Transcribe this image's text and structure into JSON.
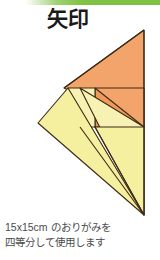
{
  "page": {
    "title": "矢印",
    "background_color": "#ffffff"
  },
  "top_rule": {
    "name": "green-accent-bar",
    "color": "#7dc242"
  },
  "figure": {
    "name": "origami-arrow-diagram",
    "colors": {
      "orange_fill": "#f2a46a",
      "orange_fill_dark": "#ef9a5c",
      "yellow_fill": "#f5efa0",
      "yellow_fill_light": "#f7f2b4",
      "outline": "#3b2a14"
    },
    "parts": [
      {
        "name": "orange-large-triangle",
        "fill": "#f2a46a"
      },
      {
        "name": "orange-small-triangle",
        "fill": "#ef9a5c"
      },
      {
        "name": "yellow-square-flap",
        "fill": "#f7f2b4"
      },
      {
        "name": "yellow-left-wing",
        "fill": "#f5efa0"
      },
      {
        "name": "yellow-center-wing",
        "fill": "#f7f2b4"
      },
      {
        "name": "yellow-right-wing",
        "fill": "#f5efa0"
      }
    ]
  },
  "caption": {
    "line1": "15x15cm のおりがみを",
    "line2": "四等分して使用します"
  }
}
